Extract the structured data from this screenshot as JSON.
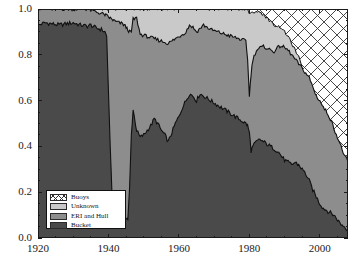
{
  "figure": {
    "background": "#ffffff",
    "axis_color": "#1a1a1a"
  },
  "chart_data": {
    "type": "area",
    "stacked": true,
    "normalized": true,
    "title": "",
    "xlabel": "",
    "ylabel": "",
    "xlim": [
      1920,
      2008
    ],
    "ylim": [
      0.0,
      1.0
    ],
    "grid": false,
    "legend_position": "lower-left",
    "x_ticks": [
      1920,
      1940,
      1960,
      1980,
      2000
    ],
    "x_tick_labels": [
      "1920",
      "1940",
      "1960",
      "1980",
      "2000"
    ],
    "x_minor_tick_step": 5,
    "y_ticks": [
      0.0,
      0.2,
      0.4,
      0.6,
      0.8,
      1.0
    ],
    "y_tick_labels": [
      "0.0",
      "0.2",
      "0.4",
      "0.6",
      "0.8",
      "1.0"
    ],
    "y_minor_tick_step": 0.05,
    "colors": {
      "bucket": "#4a4a4a",
      "eri_and_hull": "#8d8d8d",
      "unknown": "#c9c9c9",
      "buoys": "#ffffff",
      "buoys_hatch_line": "#2f2f2f",
      "outline": "#101010"
    },
    "series": [
      {
        "name": "Bucket",
        "key": "bucket",
        "order": 1,
        "fill": "#4a4a4a",
        "hatch": "none",
        "x": [
          1920,
          1922,
          1924,
          1926,
          1928,
          1930,
          1932,
          1934,
          1935,
          1936,
          1937,
          1938,
          1939,
          1939.5,
          1940,
          1940.5,
          1941,
          1941.5,
          1942,
          1943,
          1944,
          1944.5,
          1945,
          1945.5,
          1946,
          1946.5,
          1947,
          1948,
          1949,
          1950,
          1951,
          1952,
          1953,
          1954,
          1955,
          1956,
          1957,
          1958,
          1959,
          1960,
          1961,
          1962,
          1963,
          1964,
          1965,
          1966,
          1967,
          1968,
          1969,
          1970,
          1971,
          1972,
          1973,
          1974,
          1975,
          1976,
          1977,
          1978,
          1979,
          1979.5,
          1980,
          1980.5,
          1981,
          1982,
          1983,
          1984,
          1985,
          1986,
          1987,
          1988,
          1989,
          1990,
          1991,
          1992,
          1993,
          1994,
          1995,
          1996,
          1997,
          1998,
          1999,
          2000,
          2001,
          2002,
          2003,
          2004,
          2005,
          2006,
          2007,
          2008
        ],
        "y": [
          0.93,
          0.94,
          0.935,
          0.93,
          0.935,
          0.94,
          0.93,
          0.925,
          0.93,
          0.92,
          0.915,
          0.91,
          0.9,
          0.88,
          0.64,
          0.4,
          0.2,
          0.14,
          0.13,
          0.12,
          0.11,
          0.1,
          0.09,
          0.08,
          0.22,
          0.45,
          0.56,
          0.47,
          0.44,
          0.45,
          0.47,
          0.49,
          0.52,
          0.5,
          0.47,
          0.45,
          0.42,
          0.46,
          0.5,
          0.53,
          0.57,
          0.6,
          0.63,
          0.62,
          0.6,
          0.63,
          0.62,
          0.61,
          0.6,
          0.59,
          0.58,
          0.57,
          0.56,
          0.55,
          0.54,
          0.53,
          0.52,
          0.51,
          0.5,
          0.49,
          0.46,
          0.38,
          0.4,
          0.42,
          0.43,
          0.42,
          0.41,
          0.4,
          0.39,
          0.38,
          0.36,
          0.34,
          0.33,
          0.32,
          0.33,
          0.32,
          0.3,
          0.28,
          0.25,
          0.21,
          0.18,
          0.15,
          0.13,
          0.12,
          0.11,
          0.1,
          0.08,
          0.06,
          0.05,
          0.035
        ]
      },
      {
        "name": "ERI and Hull",
        "key": "eri_and_hull",
        "order": 2,
        "fill": "#8d8d8d",
        "hatch": "none",
        "note": "cumulative top of Bucket + ERI and Hull",
        "cum_top": [
          1.0,
          1.0,
          1.0,
          1.0,
          1.0,
          1.0,
          1.0,
          1.0,
          0.995,
          0.99,
          0.985,
          0.98,
          0.975,
          0.97,
          0.965,
          0.96,
          0.955,
          0.95,
          0.945,
          0.94,
          0.935,
          0.93,
          0.92,
          0.91,
          0.9,
          0.9,
          0.955,
          0.96,
          0.89,
          0.885,
          0.88,
          0.875,
          0.87,
          0.865,
          0.86,
          0.855,
          0.85,
          0.86,
          0.87,
          0.88,
          0.89,
          0.9,
          0.93,
          0.92,
          0.9,
          0.915,
          0.93,
          0.92,
          0.91,
          0.905,
          0.9,
          0.895,
          0.89,
          0.885,
          0.88,
          0.875,
          0.87,
          0.865,
          0.86,
          0.78,
          0.62,
          0.72,
          0.78,
          0.82,
          0.83,
          0.835,
          0.83,
          0.82,
          0.815,
          0.83,
          0.84,
          0.83,
          0.82,
          0.8,
          0.78,
          0.76,
          0.74,
          0.72,
          0.7,
          0.66,
          0.62,
          0.6,
          0.57,
          0.55,
          0.52,
          0.48,
          0.44,
          0.4,
          0.36,
          0.33
        ]
      },
      {
        "name": "Unknown",
        "key": "unknown",
        "order": 3,
        "fill": "#c9c9c9",
        "hatch": "none",
        "note": "cumulative top of Bucket + ERI/Hull + Unknown; equals 1.0 before 1980, then declines as Buoys grow",
        "cum_top": [
          1.0,
          1.0,
          1.0,
          1.0,
          1.0,
          1.0,
          1.0,
          1.0,
          1.0,
          1.0,
          1.0,
          1.0,
          1.0,
          1.0,
          1.0,
          1.0,
          1.0,
          1.0,
          1.0,
          1.0,
          1.0,
          1.0,
          1.0,
          1.0,
          1.0,
          1.0,
          1.0,
          1.0,
          1.0,
          1.0,
          1.0,
          1.0,
          1.0,
          1.0,
          1.0,
          1.0,
          1.0,
          1.0,
          1.0,
          1.0,
          1.0,
          1.0,
          1.0,
          1.0,
          1.0,
          1.0,
          1.0,
          1.0,
          1.0,
          1.0,
          1.0,
          1.0,
          1.0,
          1.0,
          1.0,
          1.0,
          1.0,
          1.0,
          1.0,
          1.0,
          0.98,
          0.98,
          0.985,
          0.99,
          0.985,
          0.975,
          0.96,
          0.945,
          0.93,
          0.925,
          0.92,
          0.9,
          0.88,
          0.85,
          0.82,
          0.79,
          0.74,
          0.7,
          0.66,
          0.6,
          0.55,
          0.52,
          0.5,
          0.47,
          0.45,
          0.43,
          0.41,
          0.38,
          0.36,
          0.345
        ]
      },
      {
        "name": "Buoys",
        "key": "buoys",
        "order": 4,
        "fill": "#ffffff",
        "hatch": "cross-diagonal",
        "note": "region between Unknown cumulative top and 1.0; first appears ~1980",
        "start_year": 1980,
        "fraction_2008": 0.655
      }
    ]
  },
  "legend": {
    "name": "legend-box",
    "entries": [
      {
        "label": "Buoys",
        "swatch": "#ffffff",
        "hatch": "cross-diagonal"
      },
      {
        "label": "Unknown",
        "swatch": "#c9c9c9",
        "hatch": "none"
      },
      {
        "label": "ERI and Hull",
        "swatch": "#8d8d8d",
        "hatch": "none"
      },
      {
        "label": "Bucket",
        "swatch": "#4a4a4a",
        "hatch": "none"
      }
    ]
  },
  "axes": {
    "y_labels": [
      "1.0",
      "0.8",
      "0.6",
      "0.4",
      "0.2",
      "0.0"
    ],
    "x_labels": [
      "1920",
      "1940",
      "1960",
      "1980",
      "2000"
    ]
  }
}
